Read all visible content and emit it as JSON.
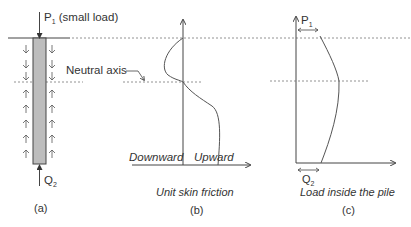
{
  "figure": {
    "panel_a": {
      "load_label": "P",
      "load_sub": "1",
      "load_note": " (small load)",
      "tip_label": "Q",
      "tip_sub": "2",
      "neutral_axis_label": "Neutral axis",
      "caption": "(a)"
    },
    "panel_b": {
      "left_label": "Downward",
      "right_label": "Upward",
      "axis_title": "Unit skin friction",
      "caption": "(b)"
    },
    "panel_c": {
      "top_label": "P",
      "top_sub": "1",
      "bottom_label": "Q",
      "bottom_sub": "2",
      "axis_title": "Load inside the pile",
      "caption": "(c)"
    },
    "colors": {
      "line": "#444444",
      "pile_fill": "#bdbdbd",
      "dashed": "#777777"
    }
  }
}
